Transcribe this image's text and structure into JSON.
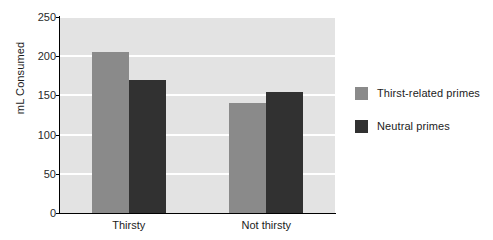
{
  "chart_data": {
    "type": "bar",
    "title": "",
    "xlabel": "",
    "ylabel": "mL Consumed",
    "categories": [
      "Thirsty",
      "Not thirsty"
    ],
    "yticks": [
      0,
      50,
      100,
      150,
      200,
      250
    ],
    "ylim": [
      0,
      250
    ],
    "grid": true,
    "legend_position": "right",
    "series": [
      {
        "name": "Thirst-related primes",
        "color": "#8a8a8a",
        "values": [
          206,
          140
        ]
      },
      {
        "name": "Neutral primes",
        "color": "#313131",
        "values": [
          170,
          154
        ]
      }
    ]
  },
  "style": {
    "plot_background": "#e3e3e3",
    "gridline_color": "#ffffff",
    "axis_color": "#000000",
    "page_background": "#ffffff",
    "text_color": "#1c1c1c"
  }
}
